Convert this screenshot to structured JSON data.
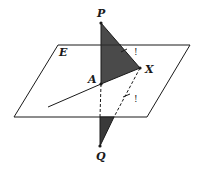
{
  "diagram": {
    "type": "3d-geometry",
    "colors": {
      "stroke": "#1a1a1a",
      "fill_dark": "#4a4a4a",
      "background": "#ffffff"
    },
    "labels": {
      "plane": "E",
      "point_p": "P",
      "point_a": "A",
      "point_x": "X",
      "point_q": "Q",
      "mark_upper": "!",
      "mark_lower": "!"
    },
    "points": {
      "P": [
        101,
        23
      ],
      "A": [
        101,
        84
      ],
      "X": [
        140,
        68
      ],
      "Q": [
        100,
        146
      ]
    },
    "plane_corners": [
      [
        58,
        45
      ],
      [
        190,
        45
      ],
      [
        147,
        117
      ],
      [
        14,
        117
      ]
    ]
  }
}
